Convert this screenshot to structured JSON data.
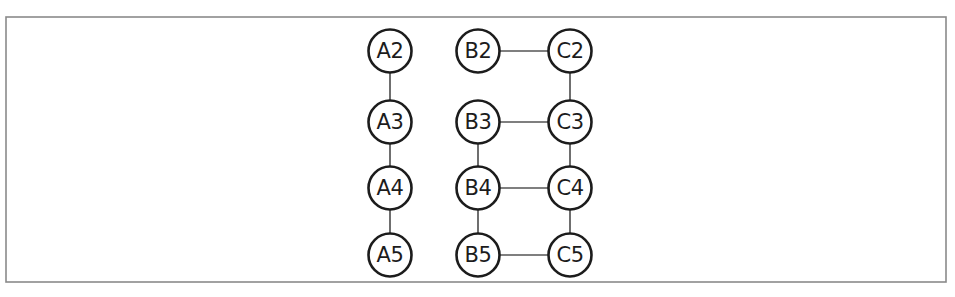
{
  "figure": {
    "background_color": "#ffffff",
    "width": 955,
    "height": 297
  },
  "frame": {
    "name": "outer-border",
    "x": 6,
    "y": 17,
    "width": 940,
    "height": 265,
    "stroke_color": "#8a8a8a",
    "stroke_width": 1.6
  },
  "style": {
    "node_fill": "#ffffff",
    "node_stroke": "#1c1c1c",
    "node_stroke_width": 2.6,
    "node_radius": 21.5,
    "label_color": "#1c1c1c",
    "label_font_size": 21,
    "edge_color": "#555555",
    "edge_width": 1.7
  },
  "chart_data": {
    "type": "graph",
    "title": "",
    "xlabel": "",
    "ylabel": "",
    "layout": "grid",
    "directed": false,
    "node_count": 12,
    "edge_count": 12,
    "columns": [
      {
        "id": "A",
        "x": 390,
        "node_ids": [
          "A2",
          "A3",
          "A4",
          "A5"
        ]
      },
      {
        "id": "B",
        "x": 478,
        "node_ids": [
          "B2",
          "B3",
          "B4",
          "B5"
        ]
      },
      {
        "id": "C",
        "x": 570,
        "node_ids": [
          "C2",
          "C3",
          "C4",
          "C5"
        ]
      }
    ],
    "rows": [
      {
        "id": "2",
        "y": 51
      },
      {
        "id": "3",
        "y": 122
      },
      {
        "id": "4",
        "y": 188
      },
      {
        "id": "5",
        "y": 255
      }
    ],
    "nodes": [
      {
        "id": "A2",
        "label": "A2",
        "x": 390,
        "y": 51
      },
      {
        "id": "A3",
        "label": "A3",
        "x": 390,
        "y": 122
      },
      {
        "id": "A4",
        "label": "A4",
        "x": 390,
        "y": 188
      },
      {
        "id": "A5",
        "label": "A5",
        "x": 390,
        "y": 255
      },
      {
        "id": "B2",
        "label": "B2",
        "x": 478,
        "y": 51
      },
      {
        "id": "B3",
        "label": "B3",
        "x": 478,
        "y": 122
      },
      {
        "id": "B4",
        "label": "B4",
        "x": 478,
        "y": 188
      },
      {
        "id": "B5",
        "label": "B5",
        "x": 478,
        "y": 255
      },
      {
        "id": "C2",
        "label": "C2",
        "x": 570,
        "y": 51
      },
      {
        "id": "C3",
        "label": "C3",
        "x": 570,
        "y": 122
      },
      {
        "id": "C4",
        "label": "C4",
        "x": 570,
        "y": 188
      },
      {
        "id": "C5",
        "label": "C5",
        "x": 570,
        "y": 255
      }
    ],
    "edges": [
      {
        "source": "A2",
        "target": "A3",
        "orientation": "vertical"
      },
      {
        "source": "A3",
        "target": "A4",
        "orientation": "vertical"
      },
      {
        "source": "A4",
        "target": "A5",
        "orientation": "vertical"
      },
      {
        "source": "B2",
        "target": "C2",
        "orientation": "horizontal"
      },
      {
        "source": "B3",
        "target": "C3",
        "orientation": "horizontal"
      },
      {
        "source": "B4",
        "target": "C4",
        "orientation": "horizontal"
      },
      {
        "source": "B5",
        "target": "C5",
        "orientation": "horizontal"
      },
      {
        "source": "B3",
        "target": "B4",
        "orientation": "vertical"
      },
      {
        "source": "B4",
        "target": "B5",
        "orientation": "vertical"
      },
      {
        "source": "C2",
        "target": "C3",
        "orientation": "vertical"
      },
      {
        "source": "C3",
        "target": "C4",
        "orientation": "vertical"
      },
      {
        "source": "C4",
        "target": "C5",
        "orientation": "vertical"
      }
    ],
    "missing_edges": [
      {
        "source": "B2",
        "target": "B3",
        "note": "no link drawn between B2 and B3"
      }
    ]
  }
}
